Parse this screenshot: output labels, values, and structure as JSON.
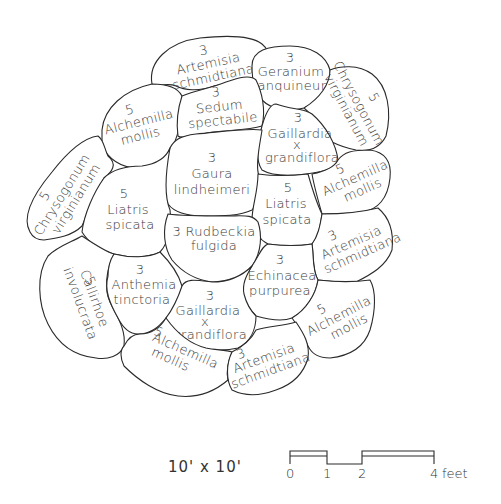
{
  "diagram": {
    "type": "garden planting plan",
    "beds": [
      {
        "id": "artemisia-top",
        "qty": "3",
        "line1": "Artemisia",
        "line2": "schmidtiana"
      },
      {
        "id": "geranium",
        "qty": "3",
        "line1": "Geranium",
        "line2": "sanquineum"
      },
      {
        "id": "chrysogonum-right",
        "qty": "5",
        "line1": "Chrysogonum",
        "line2": "virginianum"
      },
      {
        "id": "alchemilla-upper-left",
        "qty": "5",
        "line1": "Alchemilla",
        "line2": "mollis"
      },
      {
        "id": "sedum",
        "qty": "3",
        "line1": "Sedum",
        "line2": "spectabile"
      },
      {
        "id": "gaillardia-upper",
        "qty": "3",
        "line1": "Gaillardia",
        "line2": "x",
        "line3": "grandiflora"
      },
      {
        "id": "alchemilla-right",
        "qty": "5",
        "line1": "Alchemilla",
        "line2": "mollis"
      },
      {
        "id": "chrysogonum-left",
        "qty": "5",
        "line1": "Chrysogonum",
        "line2": "virginianum"
      },
      {
        "id": "gaura",
        "qty": "3",
        "line1": "Gaura",
        "line2": "lindheimeri"
      },
      {
        "id": "liatris-left",
        "qty": "5",
        "line1": "Liatris",
        "line2": "spicata"
      },
      {
        "id": "liatris-right",
        "qty": "5",
        "line1": "Liatris",
        "line2": "spicata"
      },
      {
        "id": "rudbeckia",
        "qty": "3",
        "line1": "Rudbeckia",
        "line2": "fulgida"
      },
      {
        "id": "artemisia-right",
        "qty": "3",
        "line1": "Artemisia",
        "line2": "schmidtiana"
      },
      {
        "id": "callirhoe",
        "qty": "5",
        "line1": "Callirhoe",
        "line2": "involucrata"
      },
      {
        "id": "anthemia",
        "qty": "3",
        "line1": "Anthemia",
        "line2": "tinctoria"
      },
      {
        "id": "echinacea",
        "qty": "3",
        "line1": "Echinacea",
        "line2": "purpurea"
      },
      {
        "id": "gaillardia-lower",
        "qty": "3",
        "line1": "Gaillardia",
        "line2": "x",
        "line3": "grandiflora"
      },
      {
        "id": "alchemilla-lower-right",
        "qty": "5",
        "line1": "Alchemilla",
        "line2": "mollis"
      },
      {
        "id": "alchemilla-bottom",
        "qty": "5",
        "line1": "Alchemilla",
        "line2": "mollis"
      },
      {
        "id": "artemisia-bottom",
        "qty": "3",
        "line1": "Artemisia",
        "line2": "schmidtiana"
      }
    ]
  },
  "footer": {
    "dimensions": "10' x 10'",
    "scale": {
      "ticks": [
        "0",
        "1",
        "2",
        "4"
      ],
      "unit": "feet",
      "last_label": "4 feet"
    }
  },
  "colors": {
    "line": "#2a2a2a",
    "text": "#3a3a3a",
    "background": "#ffffff"
  }
}
